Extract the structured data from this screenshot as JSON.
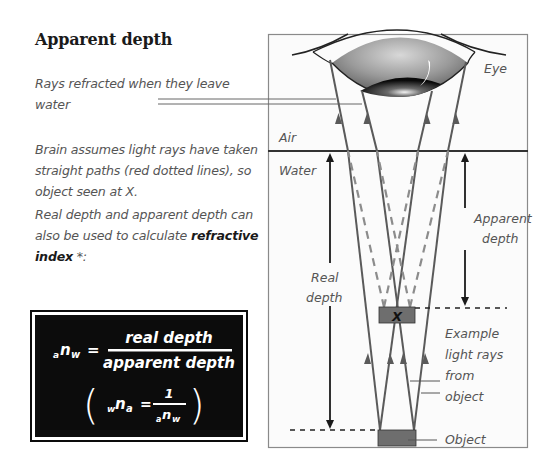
{
  "title": "Apparent depth",
  "notes": {
    "refracted": "Rays refracted when they leave water",
    "brain": "Brain assumes light rays have taken straight paths (red dotted lines), so object seen at X.",
    "refractive_prefix": "Real depth and apparent depth can also be used to calculate ",
    "refractive_bold": "refractive index",
    "refractive_suffix": " *:"
  },
  "formula": {
    "lhs_pre": "a",
    "lhs_main": "n",
    "lhs_sub": "w",
    "equals": "=",
    "numerator": "real depth",
    "denominator": "apparent depth",
    "inverse_lhs_pre": "w",
    "inverse_lhs_main": "n",
    "inverse_lhs_sub": "a",
    "inverse_numerator": "1",
    "inverse_den_pre": "a",
    "inverse_den_main": "n",
    "inverse_den_sub": "w",
    "paren_open": "(",
    "paren_close": ")"
  },
  "diagram": {
    "labels": {
      "eye": "Eye",
      "air": "Air",
      "water": "Water",
      "apparent_depth_1": "Apparent",
      "apparent_depth_2": "depth",
      "real_depth_1": "Real",
      "real_depth_2": "depth",
      "image_mark": "X",
      "example_1": "Example",
      "example_2": "light rays",
      "example_3": "from",
      "example_4": "object",
      "object": "Object"
    },
    "colors": {
      "frame": "#8a8a8a",
      "ray": "#5a5a5a",
      "dashed_ray": "#8c8c8c",
      "object_fill": "#6e6e6e",
      "water_line": "#333333",
      "arrow": "#1a1a1a"
    }
  }
}
